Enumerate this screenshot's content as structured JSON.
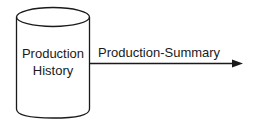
{
  "diagram": {
    "datastore": {
      "shape": "cylinder",
      "label_line1": "Production",
      "label_line2": "History"
    },
    "flow": {
      "label": "Production-Summary",
      "direction": "right"
    },
    "colors": {
      "stroke": "#1a1a1a",
      "background": "#ffffff"
    }
  }
}
